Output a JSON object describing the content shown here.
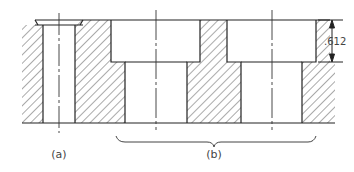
{
  "diagram": {
    "labels": {
      "part_a": "(a)",
      "part_b": "(b)",
      "dimension": ".612"
    },
    "colors": {
      "line": "#222222",
      "hatch": "#555555",
      "background": "#ffffff"
    }
  }
}
